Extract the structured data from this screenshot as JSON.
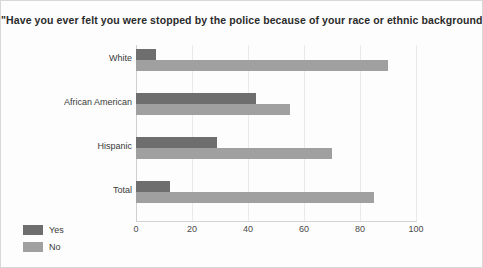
{
  "chart_data": {
    "type": "bar",
    "orientation": "horizontal",
    "title": "\"Have you ever felt you were stopped by the police because of your race or ethnic background?\"",
    "xlabel": "",
    "ylabel": "",
    "xlim": [
      0,
      100
    ],
    "xticks": [
      0,
      20,
      40,
      60,
      80,
      100
    ],
    "xtick_labels": [
      "0",
      "20",
      "40",
      "60",
      "80",
      "100"
    ],
    "grid": true,
    "grid_axis": "x",
    "legend_position": "bottom-left",
    "categories": [
      "White",
      "African American",
      "Hispanic",
      "Total"
    ],
    "series": [
      {
        "name": "Yes",
        "color": "#6e6e6e",
        "values": [
          7,
          43,
          29,
          12
        ]
      },
      {
        "name": "No",
        "color": "#a0a0a0",
        "values": [
          90,
          55,
          70,
          85
        ]
      }
    ]
  },
  "colors": {
    "yes": "#6e6e6e",
    "no": "#a0a0a0",
    "background": "#fdfdfd",
    "gridline": "#e9e9e9",
    "axis": "#d3d3d3",
    "text": "#3a3a3a",
    "title_text": "#2b2b2b",
    "border": "#d8d8d8"
  }
}
